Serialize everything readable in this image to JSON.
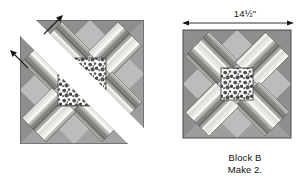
{
  "figure": {
    "kind": "quilt-block-assembly-diagram",
    "background_color": "#ffffff"
  },
  "dimension": {
    "label": "14½\"",
    "value": "14.5",
    "unit": "inches",
    "applies_to": "block-b-finished-width"
  },
  "caption": {
    "line1": "Block B",
    "line2": "Make 2."
  },
  "left_diagram": {
    "name": "exploded-assembly-view",
    "description": "Block shown split along two diagonals with white gaps and arrows indicating units being joined",
    "arrows": [
      {
        "name": "assembly-arrow-upper",
        "direction": "up-right"
      },
      {
        "name": "assembly-arrow-lower",
        "direction": "up-left"
      }
    ]
  },
  "right_diagram": {
    "name": "finished-block-view",
    "description": "Completed Block B with measured width"
  },
  "palette": {
    "stripe_light": "#ededea",
    "stripe_white": "#fafaf8",
    "stripe_medium": "#b9b9b6",
    "stripe_dark": "#8d8d8a",
    "stripe_darkest": "#6f6f6d",
    "corner_dark": "#8e8e8c",
    "corner_medium": "#a9a9a7",
    "corner_light": "#bcbcba",
    "center_print_bg": "#ffffff",
    "center_print_ink": "#4a4a48",
    "outline": "#4a4a48",
    "text": "#111111",
    "page_bg": "#ffffff"
  },
  "stripe_sequence": [
    {
      "name": "band-light",
      "color": "#e6e6e3"
    },
    {
      "name": "band-white",
      "color": "#fbfbf9"
    },
    {
      "name": "band-medium",
      "color": "#b5b5b2"
    },
    {
      "name": "band-dark",
      "color": "#858583"
    },
    {
      "name": "band-darkest",
      "color": "#6e6e6c"
    },
    {
      "name": "band-medium2",
      "color": "#a3a3a0"
    },
    {
      "name": "band-white2",
      "color": "#f4f4f1"
    },
    {
      "name": "band-light2",
      "color": "#dcdcd9"
    }
  ]
}
